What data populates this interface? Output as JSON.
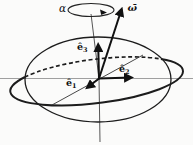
{
  "diagram": {
    "labels": {
      "alpha": "α",
      "omega": "ω̄",
      "e1_base": "ê",
      "e1_sub": "1",
      "e2_base": "ê",
      "e2_sub": "2",
      "e3_base": "ê",
      "e3_sub": "3"
    },
    "colors": {
      "ink": "#1c1c1c",
      "horizontal_axis_gray": "#9f9f9f",
      "vertical_axis_gray": "#555555",
      "background": "#fbfbfa"
    }
  }
}
